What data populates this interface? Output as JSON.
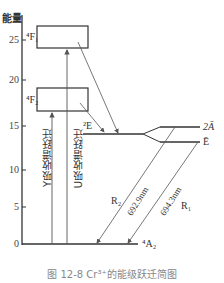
{
  "chart": {
    "type": "energy_level_diagram",
    "ylabel": "能量",
    "yticks": [
      "0",
      "5",
      "10",
      "15",
      "20",
      "25"
    ],
    "levels": [
      {
        "id": "4F1",
        "label": "⁴F₁",
        "kind": "band"
      },
      {
        "id": "4F2",
        "label": "⁴F₂",
        "kind": "band"
      },
      {
        "id": "2E",
        "label": "²E",
        "kind": "level"
      },
      {
        "id": "2A",
        "label": "2Ā",
        "kind": "split"
      },
      {
        "id": "E",
        "label": "Ē",
        "kind": "split"
      },
      {
        "id": "4A2",
        "label": "⁴A₂",
        "kind": "ground"
      }
    ],
    "transitions": [
      {
        "label": "Y吸收谱跃迁",
        "from": "4A2",
        "to": "4F2"
      },
      {
        "label": "U吸收谱跃迁",
        "from": "4A2",
        "to": "4F1"
      },
      {
        "label": "R₂",
        "wavelength": "692.9nm",
        "from": "2A",
        "to": "4A2"
      },
      {
        "label": "R₁",
        "wavelength": "694.3nm",
        "from": "E",
        "to": "4A2"
      }
    ],
    "r2_label": "R₂",
    "r1_label": "R₁",
    "r2_wavelength": "692.9nm",
    "r1_wavelength": "694.3nm",
    "y_absorption": "Y吸收谱跃迁",
    "u_absorption": "U吸收谱跃迁"
  },
  "caption": "图 12-8   Cr³⁺的能级跃迁简图",
  "colors": {
    "line": "#333333",
    "arrow": "#555555",
    "caption": "#888888"
  }
}
